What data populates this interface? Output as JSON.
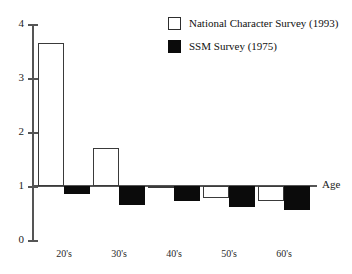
{
  "chart_data": {
    "type": "bar",
    "title": "",
    "xlabel": "Age",
    "ylabel": "",
    "categories": [
      "20's",
      "30's",
      "40's",
      "50's",
      "60's"
    ],
    "ylim": [
      0,
      4
    ],
    "yticks": [
      0,
      1,
      2,
      3,
      4
    ],
    "ytick_labels": [
      "0",
      "1",
      "2",
      "3",
      "4"
    ],
    "baseline": 1,
    "grid": false,
    "legend_position": "top-right",
    "series": [
      {
        "name": "National Character Survey (1993)",
        "style": "open",
        "color": "#ffffff",
        "edge_color": "#3a3a3a",
        "values": [
          3.65,
          1.7,
          0.97,
          0.78,
          0.72
        ]
      },
      {
        "name": "SSM Survey (1975)",
        "style": "filled",
        "color": "#0b0b0b",
        "edge_color": "#0b0b0b",
        "values": [
          0.85,
          0.65,
          0.72,
          0.62,
          0.55
        ]
      }
    ]
  },
  "axis": {
    "x_axis_name": "Age",
    "y_tick_0": "0",
    "y_tick_1": "1",
    "y_tick_2": "2",
    "y_tick_3": "3",
    "y_tick_4": "4"
  },
  "categories": {
    "c0": "20's",
    "c1": "30's",
    "c2": "40's",
    "c3": "50's",
    "c4": "60's"
  },
  "legend": {
    "entry_0_label": "National Character Survey (1993)",
    "entry_1_label": "SSM Survey (1975)"
  }
}
